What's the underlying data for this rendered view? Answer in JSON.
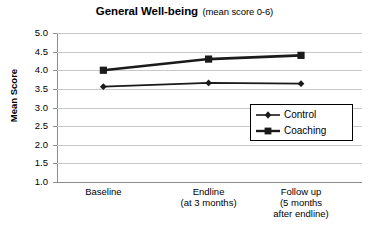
{
  "chart_data": {
    "type": "line",
    "title": "General Well-being",
    "subtitle": "(mean score 0-6)",
    "xlabel": "",
    "ylabel": "Mean Score",
    "ylim": [
      1.0,
      5.0
    ],
    "ytick_step": 0.5,
    "yticks": [
      "5.0",
      "4.5",
      "4.0",
      "3.5",
      "3.0",
      "2.5",
      "2.0",
      "1.5",
      "1.0"
    ],
    "grid": true,
    "legend_position": "inside-bottom-right",
    "categories": [
      "Baseline",
      "Endline",
      "Follow up"
    ],
    "category_labels": [
      [
        "Baseline"
      ],
      [
        "Endline",
        "(at 3 months)"
      ],
      [
        "Follow up",
        "(5 months",
        "after endline)"
      ]
    ],
    "series": [
      {
        "name": "Control",
        "marker": "diamond",
        "color": "#1a1a1a",
        "values": [
          3.56,
          3.66,
          3.64
        ]
      },
      {
        "name": "Coaching",
        "marker": "square",
        "color": "#1a1a1a",
        "values": [
          4.0,
          4.3,
          4.4
        ]
      }
    ]
  },
  "legend": {
    "items": [
      {
        "label": "Control",
        "marker": "diamond-marker-icon"
      },
      {
        "label": "Coaching",
        "marker": "square-marker-icon"
      }
    ]
  },
  "colors": {
    "series": "#1a1a1a",
    "gridline": "#c8c8c8",
    "axis": "#8c8c8c",
    "background": "#ffffff",
    "text": "#000000"
  }
}
